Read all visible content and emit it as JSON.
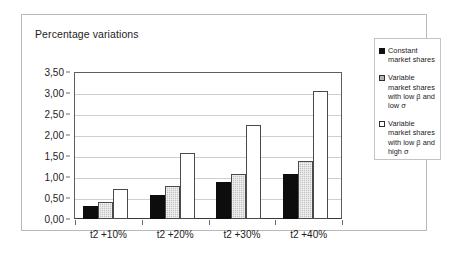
{
  "chart_data": {
    "type": "bar",
    "title": "Percentage variations",
    "xlabel": "",
    "ylabel": "",
    "ylim": [
      0,
      3.5
    ],
    "ytick_step": 0.5,
    "grid": true,
    "decimal_separator": ",",
    "legend_position": "right",
    "categories": [
      "t2 +10%",
      "t2 +20%",
      "t2 +30%",
      "t2 +40%"
    ],
    "ytick_labels": [
      "0,00",
      "0,50",
      "1,00",
      "1,50",
      "2,00",
      "2,50",
      "3,00",
      "3,50"
    ],
    "ytick_values": [
      0,
      0.5,
      1.0,
      1.5,
      2.0,
      2.5,
      3.0,
      3.5
    ],
    "series": [
      {
        "name": "Constant market shares",
        "color": "#0d0d0d",
        "fill": "solid-black",
        "values": [
          0.3,
          0.58,
          0.87,
          1.08
        ]
      },
      {
        "name": "Variable market shares with low β and low σ",
        "color": "#c2c2c2",
        "fill": "gray-dotted",
        "values": [
          0.4,
          0.78,
          1.08,
          1.37
        ]
      },
      {
        "name": "Variable market shares with low β and high σ",
        "color": "#ffffff",
        "fill": "white-hollow",
        "values": [
          0.72,
          1.57,
          2.25,
          3.05
        ]
      }
    ]
  },
  "legend": {
    "items": [
      {
        "label": "Constant market shares"
      },
      {
        "label": "Variable market shares with low β and low σ"
      },
      {
        "label": "Variable market shares with low β and high σ"
      }
    ]
  }
}
